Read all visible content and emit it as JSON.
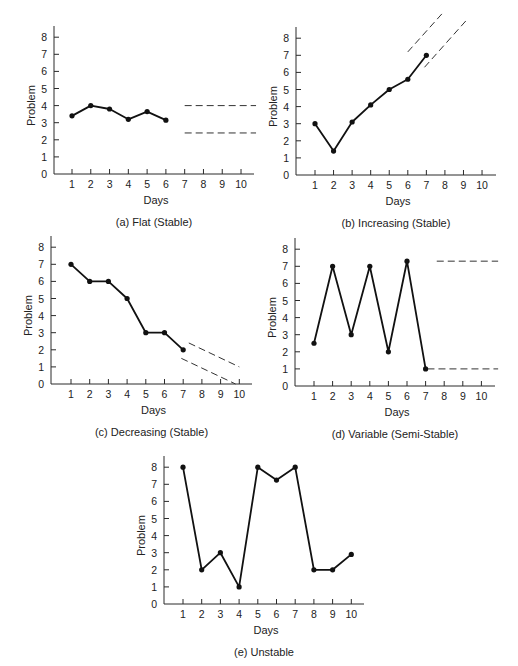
{
  "chart_data": [
    {
      "id": "a",
      "type": "line",
      "caption": "(a) Flat (Stable)",
      "xlabel": "Days",
      "ylabel": "Problem",
      "x_ticks": [
        1,
        2,
        3,
        4,
        5,
        6,
        7,
        8,
        9,
        10
      ],
      "y_ticks": [
        0,
        1,
        2,
        3,
        4,
        5,
        6,
        7,
        8
      ],
      "ylim": [
        0,
        8
      ],
      "xlim": [
        0,
        10.5
      ],
      "x": [
        1,
        2,
        3,
        4,
        5,
        6
      ],
      "values": [
        3.4,
        4.0,
        3.8,
        3.2,
        3.65,
        3.15
      ],
      "projection": "horizontal band",
      "dashed_lines": [
        {
          "x1": 7,
          "y1": 4.0,
          "x2": 10.8,
          "y2": 4.0
        },
        {
          "x1": 7,
          "y1": 2.4,
          "x2": 10.8,
          "y2": 2.4
        }
      ],
      "layout": {
        "ax": 54,
        "tick1": 72,
        "step": 18.78,
        "y0": 174,
        "unit": 17.1,
        "xend": 254,
        "ytop": 26
      }
    },
    {
      "id": "b",
      "type": "line",
      "caption": "(b) Increasing (Stable)",
      "xlabel": "Days",
      "ylabel": "Problem",
      "x_ticks": [
        1,
        2,
        3,
        4,
        5,
        6,
        7,
        8,
        9,
        10
      ],
      "y_ticks": [
        0,
        1,
        2,
        3,
        4,
        5,
        6,
        7,
        8
      ],
      "ylim": [
        0,
        8
      ],
      "xlim": [
        0,
        10.5
      ],
      "x": [
        1,
        2,
        3,
        4,
        5,
        6,
        7
      ],
      "values": [
        3.0,
        1.4,
        3.1,
        4.1,
        5.0,
        5.6,
        7.0
      ],
      "projection": "rising band",
      "dashed_lines": [
        {
          "x1": 6.0,
          "y1": 7.2,
          "x2": 7.9,
          "y2": 9.5
        },
        {
          "x1": 6.9,
          "y1": 6.3,
          "x2": 9.2,
          "y2": 9.1
        }
      ],
      "layout": {
        "ax": 296,
        "tick1": 315,
        "step": 18.56,
        "y0": 175,
        "unit": 17.1,
        "xend": 496,
        "ytop": 27
      }
    },
    {
      "id": "c",
      "type": "line",
      "caption": "(c) Decreasing (Stable)",
      "xlabel": "Days",
      "ylabel": "Problem",
      "x_ticks": [
        1,
        2,
        3,
        4,
        5,
        6,
        7,
        8,
        9,
        10
      ],
      "y_ticks": [
        0,
        1,
        2,
        3,
        4,
        5,
        6,
        7,
        8
      ],
      "ylim": [
        0,
        8
      ],
      "xlim": [
        0,
        10.5
      ],
      "x": [
        1,
        2,
        3,
        4,
        5,
        6,
        7
      ],
      "values": [
        7,
        6,
        6,
        5,
        3,
        3,
        2
      ],
      "projection": "falling band",
      "dashed_lines": [
        {
          "x1": 7.3,
          "y1": 2.4,
          "x2": 10.0,
          "y2": 1.0
        },
        {
          "x1": 6.9,
          "y1": 1.5,
          "x2": 9.8,
          "y2": 0.0
        }
      ],
      "layout": {
        "ax": 51,
        "tick1": 71,
        "step": 18.7,
        "y0": 384,
        "unit": 17.1,
        "xend": 252,
        "ytop": 236
      }
    },
    {
      "id": "d",
      "type": "line",
      "caption": "(d) Variable (Semi-Stable)",
      "xlabel": "Days",
      "ylabel": "Problem",
      "x_ticks": [
        1,
        2,
        3,
        4,
        5,
        6,
        7,
        8,
        9,
        10
      ],
      "y_ticks": [
        0,
        1,
        2,
        3,
        4,
        5,
        6,
        7,
        8
      ],
      "ylim": [
        0,
        8
      ],
      "xlim": [
        0,
        10.5
      ],
      "x": [
        1,
        2,
        3,
        4,
        5,
        6,
        7
      ],
      "values": [
        2.5,
        7.0,
        3.0,
        7.0,
        2.0,
        7.3,
        1.0
      ],
      "projection": "wide horizontal band",
      "dashed_lines": [
        {
          "x1": 7.6,
          "y1": 7.3,
          "x2": 10.9,
          "y2": 7.3
        },
        {
          "x1": 7.1,
          "y1": 1.0,
          "x2": 10.9,
          "y2": 1.0
        }
      ],
      "layout": {
        "ax": 295,
        "tick1": 314,
        "step": 18.6,
        "y0": 386,
        "unit": 17.1,
        "xend": 495,
        "ytop": 238
      }
    },
    {
      "id": "e",
      "type": "line",
      "caption": "(e) Unstable",
      "xlabel": "Days",
      "ylabel": "Problem",
      "x_ticks": [
        1,
        2,
        3,
        4,
        5,
        6,
        7,
        8,
        9,
        10
      ],
      "y_ticks": [
        0,
        1,
        2,
        3,
        4,
        5,
        6,
        7,
        8
      ],
      "ylim": [
        0,
        8
      ],
      "xlim": [
        0,
        10.5
      ],
      "x": [
        1,
        2,
        3,
        4,
        5,
        6,
        7,
        8,
        9,
        10
      ],
      "values": [
        8,
        2,
        3,
        1,
        8,
        7.25,
        8,
        2,
        2,
        2.9
      ],
      "projection": "none",
      "dashed_lines": [],
      "layout": {
        "ax": 164,
        "tick1": 183,
        "step": 18.7,
        "y0": 604,
        "unit": 17.1,
        "xend": 364,
        "ytop": 456
      }
    }
  ]
}
